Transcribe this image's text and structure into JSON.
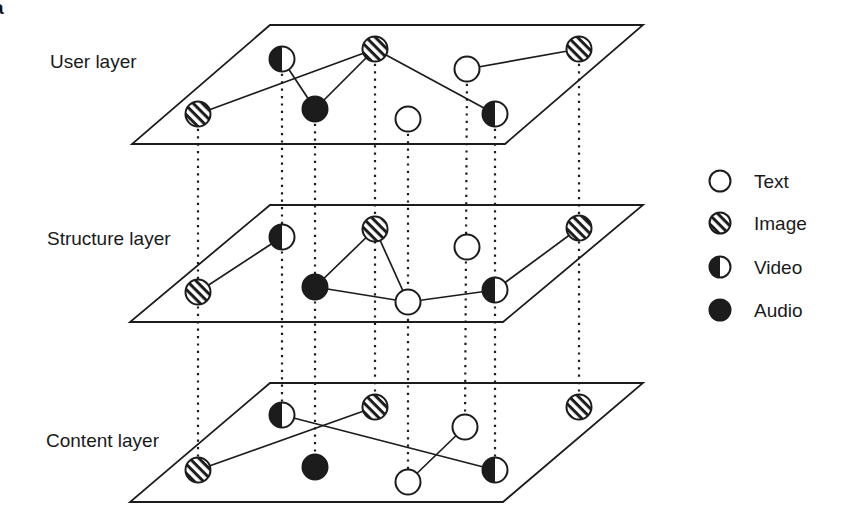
{
  "figure_label": "a",
  "colors": {
    "ink": "#1c1c1c",
    "background": "#ffffff"
  },
  "legend": {
    "items": [
      {
        "type": "text",
        "label": "Text"
      },
      {
        "type": "image",
        "label": "Image"
      },
      {
        "type": "video",
        "label": "Video"
      },
      {
        "type": "audio",
        "label": "Audio"
      }
    ]
  },
  "diagram": {
    "node_radius": 12.5,
    "layers": [
      {
        "name": "User layer",
        "plane": {
          "top_y": 25,
          "bottom_y": 144,
          "top_x1": 270,
          "top_x2": 643,
          "bottom_x1": 132,
          "bottom_x2": 505
        },
        "nodes": [
          {
            "type": "image",
            "x": 198,
            "y": 114
          },
          {
            "type": "video",
            "x": 282,
            "y": 59
          },
          {
            "type": "audio",
            "x": 315,
            "y": 109
          },
          {
            "type": "image",
            "x": 375,
            "y": 49
          },
          {
            "type": "text",
            "x": 408,
            "y": 119
          },
          {
            "type": "text",
            "x": 467,
            "y": 69
          },
          {
            "type": "video",
            "x": 495,
            "y": 114
          },
          {
            "type": "image",
            "x": 579,
            "y": 49
          }
        ],
        "edges": [
          [
            0,
            3
          ],
          [
            1,
            2
          ],
          [
            2,
            3
          ],
          [
            3,
            6
          ],
          [
            5,
            7
          ]
        ]
      },
      {
        "name": "Structure layer",
        "plane": {
          "top_y": 205,
          "bottom_y": 322,
          "top_x1": 270,
          "top_x2": 643,
          "bottom_x1": 130,
          "bottom_x2": 503
        },
        "nodes": [
          {
            "type": "image",
            "x": 198,
            "y": 292
          },
          {
            "type": "video",
            "x": 282,
            "y": 237
          },
          {
            "type": "audio",
            "x": 315,
            "y": 287
          },
          {
            "type": "image",
            "x": 375,
            "y": 229
          },
          {
            "type": "text",
            "x": 408,
            "y": 302
          },
          {
            "type": "text",
            "x": 467,
            "y": 247
          },
          {
            "type": "video",
            "x": 495,
            "y": 290
          },
          {
            "type": "image",
            "x": 579,
            "y": 228
          }
        ],
        "edges": [
          [
            0,
            1
          ],
          [
            2,
            3
          ],
          [
            3,
            4
          ],
          [
            2,
            4
          ],
          [
            4,
            6
          ],
          [
            6,
            7
          ]
        ]
      },
      {
        "name": "Content layer",
        "plane": {
          "top_y": 383,
          "bottom_y": 502,
          "top_x1": 270,
          "top_x2": 643,
          "bottom_x1": 130,
          "bottom_x2": 503
        },
        "nodes": [
          {
            "type": "image",
            "x": 198,
            "y": 470
          },
          {
            "type": "video",
            "x": 282,
            "y": 415
          },
          {
            "type": "audio",
            "x": 315,
            "y": 467
          },
          {
            "type": "image",
            "x": 375,
            "y": 407
          },
          {
            "type": "text",
            "x": 408,
            "y": 482
          },
          {
            "type": "text",
            "x": 465,
            "y": 427
          },
          {
            "type": "video",
            "x": 495,
            "y": 470
          },
          {
            "type": "image",
            "x": 579,
            "y": 407
          }
        ],
        "edges": [
          [
            0,
            3
          ],
          [
            1,
            6
          ],
          [
            5,
            4
          ]
        ]
      }
    ],
    "cross_layer_links": {
      "style": "dotted",
      "columns": [
        0,
        1,
        2,
        3,
        4,
        5,
        6,
        7
      ]
    }
  }
}
